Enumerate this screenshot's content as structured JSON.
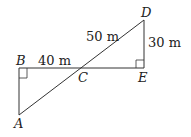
{
  "diagram": {
    "points": {
      "A": "A",
      "B": "B",
      "C": "C",
      "D": "D",
      "E": "E"
    },
    "measurements": {
      "BC": "40 m",
      "CD": "50 m",
      "DE": "30 m"
    },
    "right_angles": [
      "B",
      "E"
    ],
    "colors": {
      "line": "#333333",
      "text": "#222222"
    }
  }
}
